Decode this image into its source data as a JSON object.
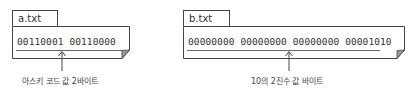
{
  "files": [
    {
      "name": "a.txt",
      "content": "00110001 00110000",
      "annotation": "아스키 코드 값 2바이트"
    },
    {
      "name": "b.txt",
      "content": "00000000 00000000 00000000 00001010",
      "annotation": "10의 2진수 값 바이트"
    }
  ],
  "colors": {
    "stroke": "#444444",
    "text": "#333333",
    "background": "#ffffff"
  }
}
